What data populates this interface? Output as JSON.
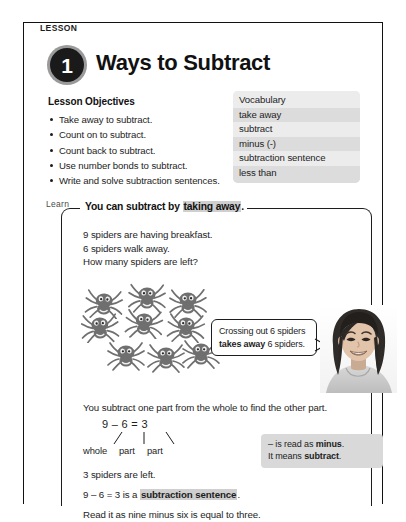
{
  "lesson": {
    "eyebrow": "LESSON",
    "number": "1",
    "title": "Ways to Subtract"
  },
  "objectives": {
    "heading": "Lesson Objectives",
    "items": [
      "Take away to subtract.",
      "Count on to subtract.",
      "Count back to subtract.",
      "Use number bonds to subtract.",
      "Write and solve subtraction sentences."
    ]
  },
  "vocabulary": {
    "heading": "Vocabulary",
    "terms": [
      "take away",
      "subtract",
      "minus (-)",
      "subtraction sentence",
      "less than"
    ]
  },
  "learn": {
    "tab_label": "Learn",
    "heading_prefix": "You can subtract by ",
    "heading_highlight": "taking away",
    "heading_suffix": ".",
    "story": [
      "9 spiders are having breakfast.",
      "6 spiders walk away.",
      "How many spiders are left?"
    ],
    "spider_count": 9,
    "callout": {
      "line1": "Crossing out 6 spiders",
      "line2_bold": "takes away",
      "line2_rest": " 6 spiders."
    },
    "subtract_sentence": "You subtract one part from the whole to find the other part.",
    "equation": "9 – 6 = 3",
    "part_labels": [
      "whole",
      "part",
      "part"
    ],
    "note": {
      "line1_prefix": "– is read as ",
      "line1_bold": "minus",
      "line1_suffix": ".",
      "line2_prefix": "It means ",
      "line2_bold": "subtract",
      "line2_suffix": "."
    },
    "answer_line": "3 spiders are left.",
    "sentence_line_prefix": "9 – 6 = 3 is a ",
    "sentence_line_highlight": "subtraction sentence",
    "sentence_line_suffix": ".",
    "read_line": "Read it as nine minus six is equal to three."
  },
  "colors": {
    "ink": "#1d1d1d",
    "badge_disc": "#1a1a1a",
    "badge_ring": "#9a9a9a",
    "vocab_shade": "#dcdcdc",
    "vocab_plain": "#ececec",
    "highlight": "#cfcfcf",
    "note_bg": "#d9d9d9",
    "spider": "#6f6f6f"
  }
}
